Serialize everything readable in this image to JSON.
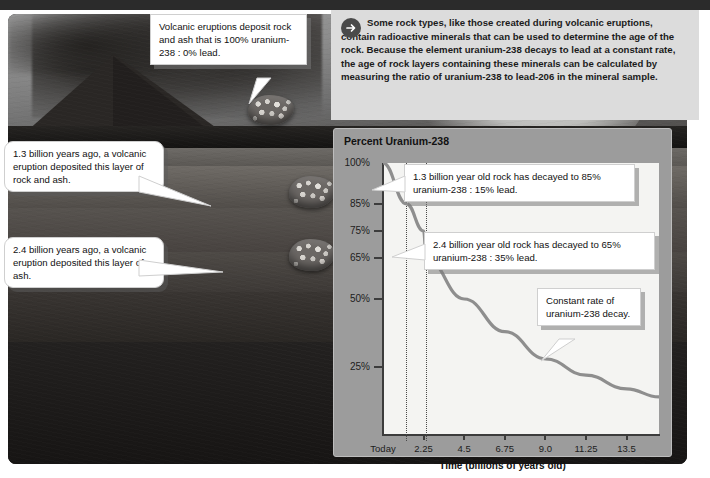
{
  "header": {
    "icon": "arrow-right-circle-icon",
    "text": "Some rock types, like those created during volcanic eruptions, contain radioactive minerals that can be used to determine the age of the rock. Because the element uranium-238 decays to lead at a constant rate, the age of rock layers containing these minerals can be calculated by measuring the ratio of uranium-238 to lead-206 in the mineral sample."
  },
  "photo": {
    "alt": "volcano-eruption-rock-layers-photo",
    "callouts": [
      {
        "id": "volcano",
        "text": "Volcanic eruptions deposit rock and ash that is 100% uranium-238 : 0% lead."
      },
      {
        "id": "layer-1-3",
        "text": "1.3 billion years ago, a volcanic eruption deposited this layer of rock and ash."
      },
      {
        "id": "layer-2-4",
        "text": "2.4 billion years ago, a volcanic eruption deposited this layer of ash."
      }
    ],
    "rock_samples": [
      "rock-sample-top",
      "rock-sample-middle",
      "rock-sample-bottom"
    ]
  },
  "chart_data": {
    "type": "line",
    "title": "Percent Uranium-238",
    "xlabel": "Time (billions of years old)",
    "ylabel": "Percent Uranium-238",
    "xtick_labels": [
      "Today",
      "2.25",
      "4.5",
      "6.75",
      "9.0",
      "11.25",
      "13.5"
    ],
    "xtick_values": [
      0,
      2.25,
      4.5,
      6.75,
      9.0,
      11.25,
      13.5
    ],
    "ytick_labels": [
      "100%",
      "85%",
      "75%",
      "65%",
      "50%",
      "25%"
    ],
    "ytick_values": [
      100,
      85,
      75,
      65,
      50,
      25
    ],
    "xlim": [
      0,
      15.3
    ],
    "ylim": [
      0,
      100
    ],
    "grid": false,
    "legend": null,
    "series": [
      {
        "name": "Uranium-238 remaining",
        "x": [
          0,
          1.3,
          2.25,
          2.4,
          4.5,
          6.75,
          9.0,
          11.25,
          13.5,
          15.3
        ],
        "y": [
          100,
          85,
          75,
          65,
          50,
          38,
          28,
          22,
          17,
          14
        ]
      }
    ],
    "markers": [
      {
        "name": "marker-1-3-billion",
        "x": 1.3,
        "label": "1.3 billion years",
        "style": "dotted-vertical"
      },
      {
        "name": "marker-2-4-billion",
        "x": 2.4,
        "label": "2.4 billion years",
        "style": "dotted-vertical"
      }
    ],
    "annotations": [
      {
        "id": "ann-85",
        "text": "1.3 billion year old rock has decayed to 85% uranium-238 : 15% lead."
      },
      {
        "id": "ann-65",
        "text": "2.4 billion year old rock has decayed to 65% uranium-238 : 35% lead."
      },
      {
        "id": "ann-const",
        "text": "Constant rate of uranium-238 decay."
      }
    ]
  },
  "colors": {
    "panel_bg": "#9c9c9c",
    "plot_bg": "#f4f4f2",
    "curve": "#8e8e8e",
    "axis": "#3c3c3c",
    "header_bg": "#dcdcdc",
    "callout_bg": "#ffffff",
    "top_rule": "#2b2b2b"
  }
}
